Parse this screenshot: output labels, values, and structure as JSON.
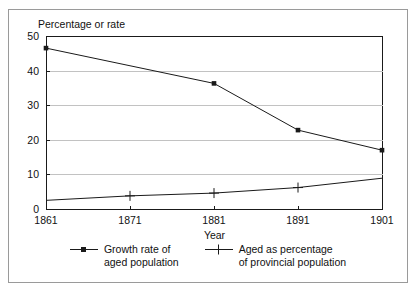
{
  "chart_data": {
    "type": "line",
    "title": "",
    "xlabel": "Year",
    "ylabel": "Percentage or rate",
    "ylabel_position": "above-axis",
    "x": [
      1861,
      1871,
      1881,
      1891,
      1901
    ],
    "categories": [
      "1861",
      "1871",
      "1881",
      "1891",
      "1901"
    ],
    "xlim": [
      1861,
      1901
    ],
    "ylim": [
      0,
      50
    ],
    "yticks": [
      0,
      10,
      20,
      30,
      40,
      50
    ],
    "ytick_labels": [
      "0",
      "10",
      "20",
      "30",
      "40",
      "50"
    ],
    "xtick_labels": [
      "1861",
      "1871",
      "1881",
      "1891",
      "1901"
    ],
    "grid": "horizontal",
    "legend_position": "bottom",
    "series": [
      {
        "name": "Growth rate of aged population",
        "name_line1": "Growth rate of",
        "name_line2": "aged population",
        "marker": "square",
        "color": "#1a1a1a",
        "values": [
          46.5,
          41.4,
          36.3,
          22.8,
          17.0
        ],
        "markers_drawn": [
          true,
          false,
          true,
          true,
          true
        ]
      },
      {
        "name": "Aged as percentage of provincial population",
        "name_line1": "Aged as percentage",
        "name_line2": "of provincial population",
        "marker": "plus",
        "color": "#1a1a1a",
        "values": [
          2.5,
          3.8,
          4.6,
          6.2,
          8.9
        ],
        "markers_drawn": [
          false,
          true,
          true,
          true,
          false
        ]
      }
    ]
  },
  "axes": {
    "y_title": "Percentage or rate",
    "x_title": "Year"
  },
  "legend": {
    "entries": [
      {
        "marker_icon": "line-square-marker-icon",
        "line1": "Growth rate of",
        "line2": "aged population"
      },
      {
        "marker_icon": "line-plus-marker-icon",
        "line1": "Aged as percentage",
        "line2": "of provincial population"
      }
    ]
  },
  "colors": {
    "frame": "#9a9a9a",
    "axis": "#1a1a1a",
    "gridline": "#c2c2c2",
    "series": "#1a1a1a",
    "background": "#ffffff"
  }
}
